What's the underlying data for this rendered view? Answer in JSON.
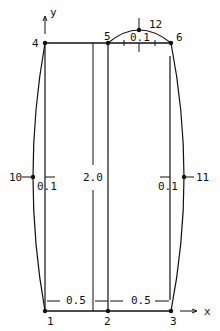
{
  "diagram": {
    "type": "finite-element mesh / bulging rectangle",
    "axes": {
      "x_label": "x",
      "y_label": "y"
    },
    "nodes": [
      {
        "id": "1",
        "x": 45,
        "y": 311
      },
      {
        "id": "2",
        "x": 108,
        "y": 311
      },
      {
        "id": "3",
        "x": 171,
        "y": 311
      },
      {
        "id": "4",
        "x": 45,
        "y": 43
      },
      {
        "id": "5",
        "x": 108,
        "y": 43
      },
      {
        "id": "6",
        "x": 171,
        "y": 43
      },
      {
        "id": "10",
        "x": 33,
        "y": 177
      },
      {
        "id": "11",
        "x": 184,
        "y": 177
      },
      {
        "id": "12",
        "x": 139,
        "y": 30
      }
    ],
    "dimensions": {
      "height": "2.0",
      "left_width": "0.5",
      "right_width": "0.5",
      "left_bulge": "0.1",
      "right_bulge": "0.1",
      "top_bulge": "0.1"
    },
    "colors": {
      "line": "#111111",
      "background": "#ffffff"
    }
  }
}
